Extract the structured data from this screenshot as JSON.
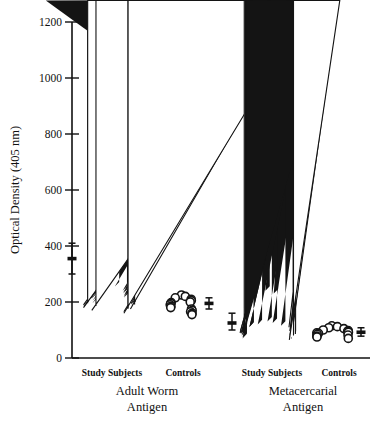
{
  "chart_data": {
    "type": "scatter",
    "title": "",
    "xlabel": "",
    "ylabel": "Optical Density (405 nm)",
    "ylim": [
      0,
      1200
    ],
    "yticks": [
      0,
      200,
      400,
      600,
      800,
      1000,
      1200
    ],
    "ytick_labels": [
      "0",
      "200",
      "400",
      "600",
      "800",
      "1000",
      "1200"
    ],
    "grid": false,
    "legend_position": "none",
    "panels": [
      {
        "name": "Adult Worm Antigen",
        "label": "Adult Worm",
        "label_line2": "Antigen",
        "groups": [
          {
            "name": "Study Subjects",
            "marker": "triangle",
            "filled_values": [
              1115,
              960,
              760,
              655,
              560,
              520,
              510,
              460,
              450,
              345,
              305,
              300,
              265,
              255,
              250,
              245,
              240,
              235,
              230,
              225,
              220,
              215,
              210,
              205,
              200,
              195,
              190,
              185
            ],
            "open_values": [
              215,
              205,
              195,
              190,
              185,
              180,
              175,
              170,
              165,
              160
            ],
            "mean": 355,
            "error_low": 300,
            "error_high": 410
          },
          {
            "name": "Controls",
            "marker": "circle-open",
            "filled_values": [],
            "open_values": [
              225,
              220,
              215,
              210,
              205,
              200,
              198,
              195,
              190,
              185,
              180,
              175,
              170,
              165,
              160,
              155
            ],
            "mean": 195,
            "error_low": 175,
            "error_high": 215
          }
        ]
      },
      {
        "name": "Metacercarial Antigen",
        "label": "Metacercarial",
        "label_line2": "Antigen",
        "groups": [
          {
            "name": "Study Subjects",
            "marker": "triangle",
            "filled_values": [
              405,
              240,
              230,
              130,
              125,
              120,
              115,
              112,
              110,
              108,
              105,
              102,
              100,
              98,
              95,
              92,
              90,
              88,
              85,
              82,
              80,
              78,
              75,
              72,
              70
            ],
            "open_values": [
              110,
              100,
              95,
              90,
              85,
              80,
              75,
              70,
              65
            ],
            "mean": 125,
            "error_low": 100,
            "error_high": 160
          },
          {
            "name": "Controls",
            "marker": "circle-open",
            "filled_values": [],
            "open_values": [
              115,
              112,
              108,
              105,
              100,
              98,
              95,
              92,
              90,
              88,
              85,
              82,
              78,
              75,
              70
            ],
            "mean": 92,
            "error_low": 78,
            "error_high": 108
          }
        ]
      }
    ]
  },
  "axis": {
    "y_title": "Optical Density (405 nm)"
  },
  "labels": {
    "study_subjects": "Study Subjects",
    "controls": "Controls",
    "adult_worm_line1": "Adult Worm",
    "adult_worm_line2": "Antigen",
    "metacercarial_line1": "Metacercarial",
    "metacercarial_line2": "Antigen"
  }
}
